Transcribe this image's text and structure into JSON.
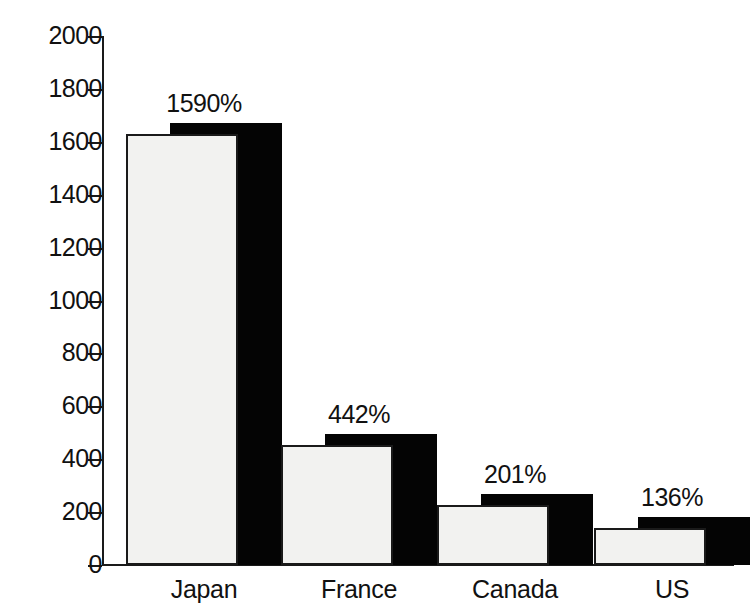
{
  "chart_data": {
    "type": "bar",
    "title": "",
    "subtitle": "",
    "xlabel": "",
    "ylabel": "",
    "categories": [
      "Japan",
      "France",
      "Canada",
      "US"
    ],
    "values": [
      1630,
      455,
      225,
      140
    ],
    "data_labels": [
      "1590%",
      "442%",
      "201%",
      "136%"
    ],
    "ylim": [
      0,
      2000
    ],
    "y_ticks": [
      0,
      200,
      400,
      600,
      800,
      1000,
      1200,
      1400,
      1600,
      1800,
      2000
    ],
    "y_tick_labels": [
      "0",
      "200",
      "400",
      "600",
      "800",
      "1000",
      "1200",
      "1400",
      "1600",
      "1800",
      "2000"
    ],
    "grid": false,
    "legend": null,
    "style": {
      "bar_fill": "#f2f2f0",
      "bar_outline": "#1a1a1a",
      "bar_shadow": "#040404",
      "axis_color": "#1a1a1a",
      "background": "#ffffff",
      "three_d_shadow": true
    }
  },
  "axis": {
    "y_labels": [
      "2000",
      "1800",
      "1600",
      "1400",
      "1200",
      "1000",
      "800",
      "600",
      "400",
      "200",
      "0"
    ]
  },
  "bars": [
    {
      "category": "Japan",
      "label": "1590%",
      "value": 1630
    },
    {
      "category": "France",
      "label": "442%",
      "value": 455
    },
    {
      "category": "Canada",
      "label": "201%",
      "value": 225
    },
    {
      "category": "US",
      "label": "136%",
      "value": 140
    }
  ]
}
